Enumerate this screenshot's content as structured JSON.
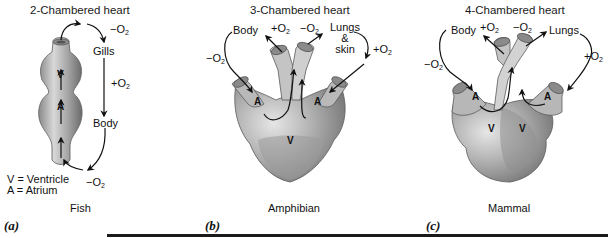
{
  "panels": [
    {
      "id": "a",
      "letter": "(a)",
      "title": "2-Chambered heart",
      "caption": "Fish",
      "labels": {
        "gills": "Gills",
        "body": "Body",
        "minus_o2_top": "−O",
        "plus_o2": "+O",
        "minus_o2_bottom": "−O",
        "ventricle": "V",
        "atrium": "A"
      },
      "legend": {
        "v": "V = Ventricle",
        "a": "A = Atrium"
      }
    },
    {
      "id": "b",
      "letter": "(b)",
      "title": "3-Chambered heart",
      "caption": "Amphibian",
      "labels": {
        "body": "Body",
        "plus_o2_top": "+O",
        "minus_o2_top": "−O",
        "lungs": "Lungs",
        "amp": "&",
        "skin": "skin",
        "minus_o2_left": "−O",
        "plus_o2_right": "+O",
        "atrium_left": "A",
        "atrium_right": "A",
        "ventricle": "V"
      }
    },
    {
      "id": "c",
      "letter": "(c)",
      "title": "4-Chambered heart",
      "caption": "Mammal",
      "labels": {
        "body": "Body",
        "plus_o2_top": "+O",
        "minus_o2_top": "−O",
        "lungs": "Lungs",
        "minus_o2_left": "−O",
        "plus_o2_right": "+O",
        "atrium_left": "A",
        "atrium_right": "A",
        "ventricle_left": "V",
        "ventricle_right": "V"
      }
    }
  ],
  "subscript": "2",
  "colors": {
    "heart_light": "#d4d4d4",
    "heart_mid": "#a8a8a8",
    "heart_dark": "#7a7a7a",
    "arrow": "#111111",
    "rule": "#1a1a1a"
  }
}
